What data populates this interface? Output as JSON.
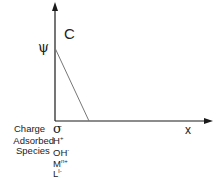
{
  "diagram": {
    "y_axis_label": "ψ",
    "curve_label": "C",
    "x_axis_label": "x",
    "row_labels": {
      "charge": "Charge",
      "adsorbed": "Adsorbed",
      "species": "Species"
    },
    "charge_symbol": "σ",
    "adsorbed_species": [
      {
        "base": "H",
        "sup": "+"
      },
      {
        "base": "OH",
        "sup": "-"
      },
      {
        "base": "M",
        "sup": "n+"
      },
      {
        "base": "L",
        "sup": "l-"
      }
    ],
    "colors": {
      "axis": "#1a1a1a",
      "curve": "#777777",
      "text": "#222222"
    }
  }
}
